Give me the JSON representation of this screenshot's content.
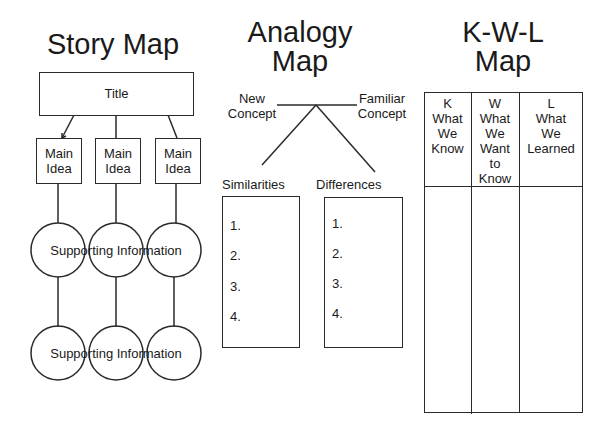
{
  "story_map": {
    "heading": "Story Map",
    "title_box": "Title",
    "main_ideas": [
      "Main\nIdea",
      "Main\nIdea",
      "Main\nIdea"
    ],
    "supporting_row_1": "Supporting Information",
    "supporting_row_2": "Supporting Information"
  },
  "analogy_map": {
    "heading_line1": "Analogy",
    "heading_line2": "Map",
    "new_concept": "New\nConcept",
    "familiar_concept": "Familiar\nConcept",
    "similarities_label": "Similarities",
    "differences_label": "Differences",
    "similarities_items": [
      "1.",
      "2.",
      "3.",
      "4."
    ],
    "differences_items": [
      "1.",
      "2.",
      "3.",
      "4."
    ]
  },
  "kwl_map": {
    "heading_line1": "K-W-L",
    "heading_line2": "Map",
    "columns": [
      {
        "letter": "K",
        "text": "What\nWe\nKnow"
      },
      {
        "letter": "W",
        "text": "What\nWe\nWant\nto\nKnow"
      },
      {
        "letter": "L",
        "text": "What\nWe\nLearned"
      }
    ]
  },
  "colors": {
    "line": "#2a2a2a",
    "text": "#1a1a1a",
    "background": "#ffffff"
  }
}
